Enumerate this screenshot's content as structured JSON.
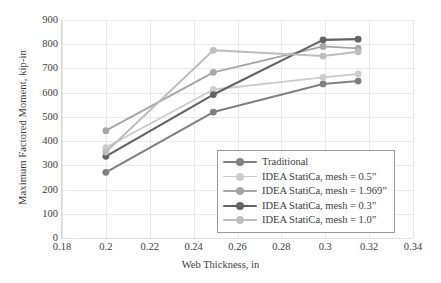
{
  "chart_data": {
    "type": "line",
    "title": "",
    "xlabel": "Web Thickness, in",
    "ylabel": "Maximum Factored Moment, kip-in",
    "xlim": [
      0.18,
      0.34
    ],
    "ylim": [
      0,
      900
    ],
    "xticks": [
      "0.18",
      "0.2",
      "0.22",
      "0.24",
      "0.26",
      "0.28",
      "0.3",
      "0.32",
      "0.34"
    ],
    "xtick_values": [
      0.18,
      0.2,
      0.22,
      0.24,
      0.26,
      0.28,
      0.3,
      0.32,
      0.34
    ],
    "yticks": [
      "0",
      "100",
      "200",
      "300",
      "400",
      "500",
      "600",
      "700",
      "800",
      "900"
    ],
    "ytick_values": [
      0,
      100,
      200,
      300,
      400,
      500,
      600,
      700,
      800,
      900
    ],
    "grid": true,
    "legend_position": "inside-lower-right",
    "x": [
      0.2,
      0.249,
      0.299,
      0.315
    ],
    "series": [
      {
        "name": "Traditional",
        "color": "#808080",
        "width": 2.1,
        "values": [
          271,
          520,
          636,
          648
        ]
      },
      {
        "name": "IDEA StatiCa, mesh = 0.5”",
        "color": "#cccccc",
        "width": 1.9,
        "values": [
          373,
          613,
          663,
          677
        ]
      },
      {
        "name": "IDEA StatiCa, mesh = 1.969”",
        "color": "#a6a6a6",
        "width": 1.9,
        "values": [
          443,
          684,
          791,
          783
        ]
      },
      {
        "name": "IDEA StatiCa, mesh = 0.3”",
        "color": "#636363",
        "width": 2.2,
        "values": [
          337,
          592,
          818,
          821
        ]
      },
      {
        "name": "IDEA StatiCa, mesh = 1.0”",
        "color": "#bdbdbd",
        "width": 2.0,
        "values": [
          355,
          775,
          751,
          769
        ]
      }
    ]
  }
}
